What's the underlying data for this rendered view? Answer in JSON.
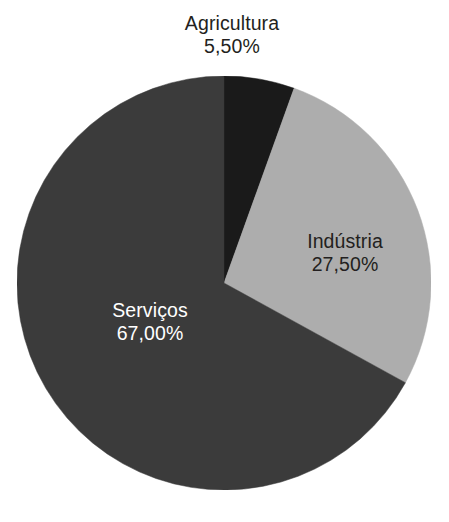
{
  "chart_data": {
    "type": "pie",
    "title": "",
    "subtitle": "",
    "xlabel": "",
    "ylabel": "",
    "legend_position": "none",
    "grid": false,
    "value_unit": "%",
    "decimal_separator": ",",
    "start_angle_deg": 0,
    "direction": "clockwise",
    "categories": [
      "Agricultura",
      "Indústria",
      "Serviços"
    ],
    "values": [
      5.5,
      27.5,
      67.0
    ],
    "slices": [
      {
        "name": "Agricultura",
        "value": 5.5,
        "value_label": "5,50%",
        "color": "#1a1a1a",
        "label_color": "#231f20",
        "label_placement": "outside-top"
      },
      {
        "name": "Indústria",
        "value": 27.5,
        "value_label": "27,50%",
        "color": "#adadad",
        "label_color": "#231f20",
        "label_placement": "inside"
      },
      {
        "name": "Serviços",
        "value": 67.0,
        "value_label": "67,00%",
        "color": "#3b3b3b",
        "label_color": "#ffffff",
        "label_placement": "inside"
      }
    ]
  },
  "labels": {
    "agricultura": {
      "name": "Agricultura",
      "value": "5,50%"
    },
    "industria": {
      "name": "Indústria",
      "value": "27,50%"
    },
    "servicos": {
      "name": "Serviços",
      "value": "67,00%"
    }
  },
  "colors": {
    "background": "#ffffff",
    "agricultura": "#1a1a1a",
    "industria": "#adadad",
    "servicos": "#3b3b3b",
    "text_dark": "#231f20",
    "text_light": "#ffffff"
  }
}
